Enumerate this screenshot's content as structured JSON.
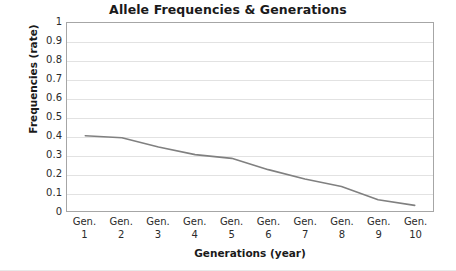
{
  "chart_data": {
    "type": "line",
    "title": "Allele Frequencies & Generations",
    "xlabel": "Generations (year)",
    "ylabel": "Frequencies (rate)",
    "categories": [
      "Gen. 1",
      "Gen. 2",
      "Gen. 3",
      "Gen. 4",
      "Gen. 5",
      "Gen. 6",
      "Gen. 7",
      "Gen. 8",
      "Gen. 9",
      "Gen. 10"
    ],
    "category_lines": [
      [
        "Gen.",
        "1"
      ],
      [
        "Gen.",
        "2"
      ],
      [
        "Gen.",
        "3"
      ],
      [
        "Gen.",
        "4"
      ],
      [
        "Gen.",
        "5"
      ],
      [
        "Gen.",
        "6"
      ],
      [
        "Gen.",
        "7"
      ],
      [
        "Gen.",
        "8"
      ],
      [
        "Gen.",
        "9"
      ],
      [
        "Gen.",
        "10"
      ]
    ],
    "values": [
      0.4,
      0.39,
      0.34,
      0.3,
      0.28,
      0.22,
      0.17,
      0.13,
      0.06,
      0.03
    ],
    "ylim": [
      0,
      1
    ],
    "ytick_values": [
      1,
      0.9,
      0.8,
      0.7,
      0.6,
      0.5,
      0.4,
      0.3,
      0.2,
      0.1,
      0
    ],
    "ytick_labels": [
      "1",
      "0.9",
      "0.8",
      "0.7",
      "0.6",
      "0.5",
      "0.4",
      "0.3",
      "0.2",
      "0.1",
      "0"
    ],
    "grid": true,
    "legend": false,
    "series_color": "#808080",
    "gridline_color": "#e2e2e2",
    "axis_border_color": "#a6a6a6",
    "background_color": "#ffffff",
    "text_color": "#1a1a1a"
  }
}
